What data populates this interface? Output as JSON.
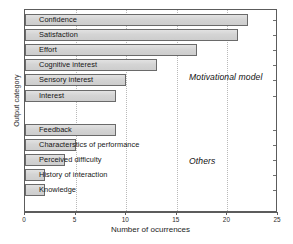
{
  "chart_data": {
    "type": "bar",
    "orientation": "horizontal",
    "title": "",
    "xlabel": "Number of ocurrences",
    "ylabel": "Output category",
    "xlim": [
      0,
      25
    ],
    "ylim_categories": 11,
    "grid": true,
    "gridlines": "vertical dotted at each x tick",
    "legend": "none",
    "xticks": [
      0,
      5,
      10,
      15,
      20,
      25
    ],
    "xticklabels": [
      "0",
      "5",
      "10",
      "15",
      "20",
      "25"
    ],
    "categories": [
      "Confidence",
      "Satisfaction",
      "Effort",
      "Cognitive interest",
      "Sensory interest",
      "Interest",
      "Feedback",
      "Characterstics of performance",
      "Perceived difficulty",
      "History of interaction",
      "Knowledge"
    ],
    "values": [
      22,
      21,
      17,
      13,
      10,
      9,
      9,
      5,
      4,
      2,
      2
    ],
    "annotations": [
      {
        "text": "Motivational model",
        "style": "italic"
      },
      {
        "text": "Others",
        "style": "italic"
      }
    ],
    "groups": [
      {
        "name": "Motivational model",
        "categories": [
          "Confidence",
          "Satisfaction",
          "Effort",
          "Cognitive interest",
          "Sensory interest",
          "Interest"
        ],
        "values": [
          22,
          21,
          17,
          13,
          10,
          9
        ]
      },
      {
        "name": "Others",
        "categories": [
          "Feedback",
          "Characterstics of performance",
          "Perceived difficulty",
          "History of interaction",
          "Knowledge"
        ],
        "values": [
          9,
          5,
          4,
          2,
          2
        ]
      }
    ],
    "colors": {
      "bar_fill": "#d8d8d8",
      "bar_border": "#6a6a6a",
      "axis": "#5c5c5c",
      "grid": "#b9b9b9",
      "text": "#161616"
    }
  }
}
